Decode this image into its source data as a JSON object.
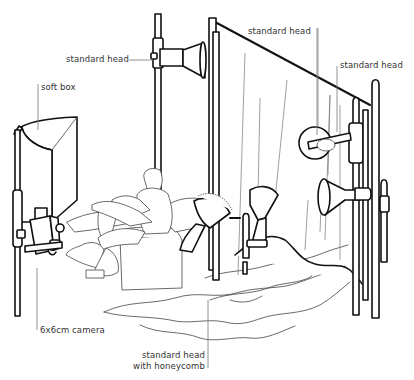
{
  "diagram": {
    "type": "studio-lighting-setup-illustration",
    "style": "black line art on white",
    "colors": {
      "background": "#ffffff",
      "ink": "#111111",
      "label_text": "#333333",
      "leader_line": "#777777"
    },
    "labels": [
      {
        "id": "standard-head-left",
        "text": "standard head"
      },
      {
        "id": "standard-head-top",
        "text": "standard head"
      },
      {
        "id": "standard-head-right",
        "text": "standard head"
      },
      {
        "id": "soft-box",
        "text": "soft box"
      },
      {
        "id": "camera",
        "text": "6x6cm camera"
      },
      {
        "id": "honeycomb-line1",
        "text": "standard head"
      },
      {
        "id": "honeycomb-line2",
        "text": "with honeycomb"
      }
    ],
    "objects": [
      "soft box on stand",
      "6x6cm camera on stand",
      "standard head on tall stand",
      "seated subject in armchair",
      "standard head with honeycomb on floor",
      "small standard head on floor",
      "backdrop curtain on frame",
      "two standard heads on right stands",
      "draped fabric on floor"
    ]
  }
}
